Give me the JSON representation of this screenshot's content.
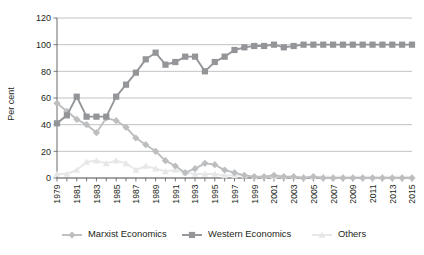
{
  "chart_data": {
    "type": "line",
    "title": "",
    "xlabel": "",
    "ylabel": "Per cent",
    "ylim": [
      0,
      120
    ],
    "ytick_step": 20,
    "yticks": [
      0,
      20,
      40,
      60,
      80,
      100,
      120
    ],
    "grid": true,
    "legend_position": "bottom",
    "x_tick_label_interval": 2,
    "x": [
      1979,
      1980,
      1981,
      1982,
      1983,
      1984,
      1985,
      1986,
      1987,
      1988,
      1989,
      1990,
      1991,
      1992,
      1993,
      1994,
      1995,
      1996,
      1997,
      1998,
      1999,
      2000,
      2001,
      2002,
      2003,
      2004,
      2005,
      2006,
      2007,
      2008,
      2009,
      2010,
      2011,
      2012,
      2013,
      2014,
      2015
    ],
    "categories": [
      "1979",
      "1980",
      "1981",
      "1982",
      "1983",
      "1984",
      "1985",
      "1986",
      "1987",
      "1988",
      "1989",
      "1990",
      "1991",
      "1992",
      "1993",
      "1994",
      "1995",
      "1996",
      "1997",
      "1998",
      "1999",
      "2000",
      "2001",
      "2002",
      "2003",
      "2004",
      "2005",
      "2006",
      "2007",
      "2008",
      "2009",
      "2010",
      "2011",
      "2012",
      "2013",
      "2014",
      "2015"
    ],
    "tick_labels": [
      "1979",
      "1981",
      "1983",
      "1985",
      "1987",
      "1989",
      "1991",
      "1993",
      "1995",
      "1997",
      "1999",
      "2001",
      "2003",
      "2005",
      "2007",
      "2009",
      "2011",
      "2013",
      "2015"
    ],
    "series": [
      {
        "name": "Marxist Economics",
        "marker": "diamond",
        "color": "#bcbec0",
        "values": [
          56,
          50,
          44,
          40,
          34,
          45,
          43,
          38,
          30,
          25,
          20,
          13,
          9,
          4,
          7,
          11,
          10,
          6,
          4,
          2,
          1,
          1,
          2,
          1,
          1,
          0,
          1,
          0,
          0,
          0,
          0,
          0,
          0,
          0,
          0,
          0,
          0
        ]
      },
      {
        "name": "Western Economics",
        "marker": "square",
        "color": "#939598",
        "values": [
          41,
          47,
          61,
          46,
          46,
          46,
          61,
          70,
          79,
          89,
          94,
          85,
          87,
          91,
          91,
          80,
          87,
          91,
          96,
          98,
          99,
          99,
          100,
          98,
          99,
          100,
          100,
          100,
          100,
          100,
          100,
          100,
          100,
          100,
          100,
          100,
          100
        ]
      },
      {
        "name": "Others",
        "marker": "triangle",
        "color": "#e6e7e8",
        "values": [
          3,
          3,
          6,
          12,
          13,
          11,
          13,
          11,
          6,
          9,
          7,
          5,
          6,
          4,
          3,
          3,
          3,
          2,
          2,
          2,
          1,
          1,
          1,
          1,
          1,
          1,
          1,
          1,
          1,
          1,
          1,
          1,
          1,
          1,
          1,
          1,
          1
        ]
      }
    ]
  },
  "legend": {
    "items": [
      {
        "label": "Marxist Economics"
      },
      {
        "label": "Western Economics"
      },
      {
        "label": "Others"
      }
    ]
  }
}
